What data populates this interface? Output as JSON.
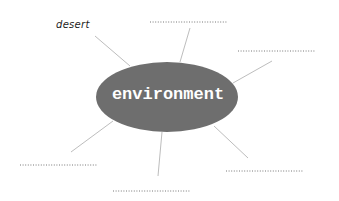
{
  "diagram": {
    "type": "spider-map",
    "center": {
      "label": "environment",
      "fill": "#6e6e6e",
      "text_color": "#ffffff"
    },
    "branches": [
      {
        "id": "top-left",
        "label": "desert"
      },
      {
        "id": "top",
        "label": ""
      },
      {
        "id": "right",
        "label": ""
      },
      {
        "id": "lower-left",
        "label": ""
      },
      {
        "id": "bottom",
        "label": ""
      },
      {
        "id": "lower-right",
        "label": ""
      }
    ],
    "line_color": "#b8b8b8",
    "dotted_color": "#777777"
  }
}
